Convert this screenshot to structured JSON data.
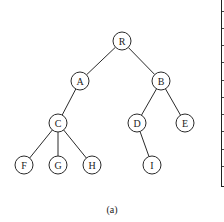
{
  "diagram": {
    "type": "tree",
    "caption": "(a)",
    "node_radius": 9,
    "nodes": [
      {
        "id": "R",
        "label": "R",
        "x": 122,
        "y": 41
      },
      {
        "id": "A",
        "label": "A",
        "x": 80,
        "y": 81
      },
      {
        "id": "B",
        "label": "B",
        "x": 161,
        "y": 81
      },
      {
        "id": "C",
        "label": "C",
        "x": 58,
        "y": 123
      },
      {
        "id": "D",
        "label": "D",
        "x": 137,
        "y": 123
      },
      {
        "id": "E",
        "label": "E",
        "x": 185,
        "y": 123
      },
      {
        "id": "F",
        "label": "F",
        "x": 24,
        "y": 165
      },
      {
        "id": "G",
        "label": "G",
        "x": 58,
        "y": 165
      },
      {
        "id": "H",
        "label": "H",
        "x": 92,
        "y": 165
      },
      {
        "id": "I",
        "label": "I",
        "x": 152,
        "y": 165
      }
    ],
    "edges": [
      [
        "R",
        "A"
      ],
      [
        "R",
        "B"
      ],
      [
        "A",
        "C"
      ],
      [
        "B",
        "D"
      ],
      [
        "B",
        "E"
      ],
      [
        "C",
        "F"
      ],
      [
        "C",
        "G"
      ],
      [
        "C",
        "H"
      ],
      [
        "D",
        "I"
      ]
    ],
    "colors": {
      "stroke": "#2a2a2a",
      "fill": "#ffffff",
      "text": "#222222"
    }
  },
  "partial_table": {
    "visible": "right-edge-only",
    "row_tick_ys": [
      11,
      28,
      45,
      62,
      80,
      97,
      114,
      131,
      149,
      166
    ]
  }
}
